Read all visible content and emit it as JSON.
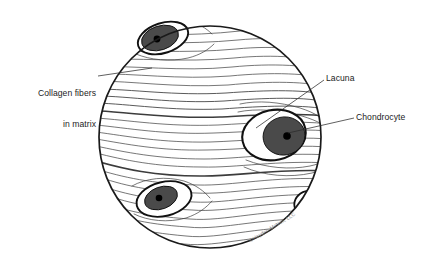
{
  "figure": {
    "kind": "histology-illustration",
    "field": {
      "shape": "circle",
      "center_x": 210,
      "center_y": 137,
      "radius": 112,
      "outline_color": "#1a1a1a",
      "fill_color": "#ffffff"
    },
    "colors": {
      "line": "#1a1a1a",
      "fiber": "#3c3c3c",
      "cell_fill": "#4a4a4a",
      "nucleus": "#000000",
      "lacuna_fill": "#ffffff",
      "label_text": "#1c1c1c",
      "leader_line": "#2b2b2b",
      "watermark": "#8a8a8a"
    }
  },
  "labels": [
    {
      "id": "collagen-fibers",
      "line1": "Collagen fibers",
      "line2": "in matrix",
      "align": "right",
      "leader_from_x": 98,
      "leader_from_y": 76,
      "leader_to_x": 152,
      "leader_to_y": 68
    },
    {
      "id": "lacuna",
      "text": "Lacuna",
      "align": "left",
      "leader_from_x": 324,
      "leader_from_y": 80,
      "leader_to_x": 256,
      "leader_to_y": 128
    },
    {
      "id": "chondrocyte",
      "text": "Chondrocyte",
      "align": "left",
      "leader_from_x": 354,
      "leader_from_y": 118,
      "leader_to_x": 288,
      "leader_to_y": 133
    }
  ],
  "cells": [
    {
      "id": "chondrocyte-top-left",
      "lacuna_cx": 163,
      "lacuna_cy": 38,
      "lacuna_rx": 26,
      "lacuna_ry": 15,
      "lacuna_rotation": -18,
      "cell_cx": 160,
      "cell_cy": 38,
      "cell_rx": 19,
      "cell_ry": 12,
      "nucleus_cx": 157,
      "nucleus_cy": 39,
      "nucleus_r": 3.4
    },
    {
      "id": "chondrocyte-mid-right",
      "lacuna_cx": 274,
      "lacuna_cy": 135,
      "lacuna_rx": 32,
      "lacuna_ry": 25,
      "lacuna_rotation": -12,
      "cell_cx": 284,
      "cell_cy": 136,
      "cell_rx": 21,
      "cell_ry": 19,
      "nucleus_cx": 287,
      "nucleus_cy": 136,
      "nucleus_r": 3.8
    },
    {
      "id": "chondrocyte-lower-left",
      "lacuna_cx": 164,
      "lacuna_cy": 199,
      "lacuna_rx": 28,
      "lacuna_ry": 17,
      "lacuna_rotation": -14,
      "cell_cx": 161,
      "cell_cy": 198,
      "cell_rx": 17,
      "cell_ry": 11,
      "nucleus_cx": 159,
      "nucleus_cy": 198,
      "nucleus_r": 3.3
    },
    {
      "id": "chondrocyte-right-edge-partial",
      "lacuna_cx": 308,
      "lacuna_cy": 203,
      "lacuna_rx": 14,
      "lacuna_ry": 12,
      "lacuna_rotation": -25,
      "cell_cx": 313,
      "cell_cy": 198,
      "cell_rx": 9,
      "cell_ry": 7,
      "nucleus_cx": 314,
      "nucleus_cy": 198,
      "nucleus_r": 2.2
    }
  ],
  "watermark": {
    "text": "©Hayden-McNeil, LLC",
    "rotation_deg": -31
  }
}
